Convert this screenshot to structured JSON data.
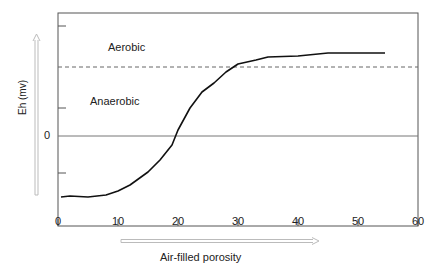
{
  "chart_data": {
    "type": "line",
    "title": "",
    "xlabel": "Air-filled porosity",
    "ylabel": "Eh (mv)",
    "xlim": [
      0,
      60
    ],
    "x_ticks": [
      0,
      10,
      20,
      30,
      40,
      50,
      60
    ],
    "y_tick_labels": [
      {
        "value": 0,
        "label": "0"
      }
    ],
    "y_unlabeled_ticks": [
      110,
      28,
      -37
    ],
    "ylim": [
      -90,
      123
    ],
    "grid": false,
    "series": [
      {
        "name": "Eh vs air-filled porosity",
        "x": [
          0.5,
          2,
          5,
          8,
          10,
          12,
          15,
          17,
          19,
          20,
          22,
          24,
          26,
          28,
          30,
          33,
          35,
          40,
          45,
          54.5
        ],
        "y": [
          -61,
          -60,
          -61,
          -59,
          -55,
          -49,
          -36,
          -24,
          -9,
          6,
          28,
          44,
          53,
          64,
          72,
          76,
          79,
          80,
          83,
          83
        ]
      }
    ],
    "reference_lines": [
      {
        "type": "horizontal",
        "y": 0,
        "style": "solid"
      },
      {
        "type": "horizontal",
        "y": 69,
        "style": "dashed"
      }
    ],
    "annotations": [
      {
        "text": "Aerobic",
        "region": "above dashed line"
      },
      {
        "text": "Anaerobic",
        "region": "below dashed line"
      }
    ]
  },
  "labels": {
    "aerobic": "Aerobic",
    "anaerobic": "Anaerobic",
    "zero": "0",
    "xlabel": "Air-filled porosity",
    "ylabel": "Eh (mv)",
    "xticks": [
      "0",
      "10",
      "20",
      "30",
      "40",
      "50",
      "60"
    ]
  }
}
